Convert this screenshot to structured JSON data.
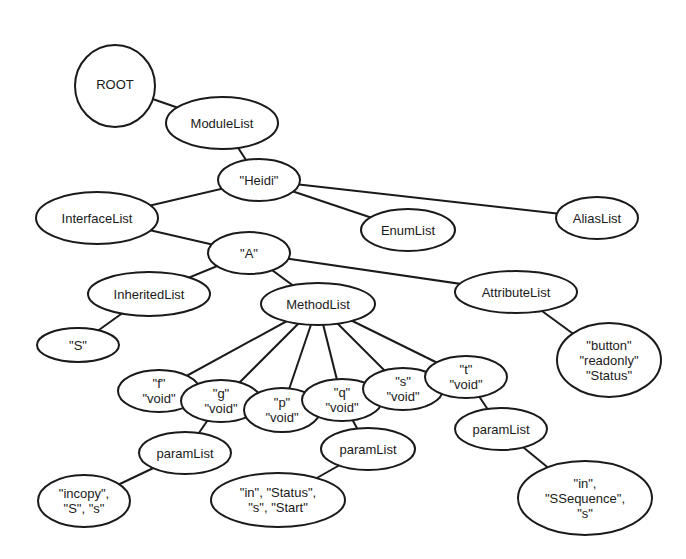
{
  "diagram": {
    "type": "tree",
    "colors": {
      "stroke": "#1a1a1a",
      "fill": "#ffffff",
      "text": "#1a1a1a",
      "background": "#ffffff"
    },
    "nodes": [
      {
        "id": "root",
        "shape": "circle",
        "cx": 115,
        "cy": 86,
        "rx": 40,
        "ry": 41,
        "lines": [
          "ROOT"
        ]
      },
      {
        "id": "modulelist",
        "shape": "ellipse",
        "cx": 222,
        "cy": 123,
        "rx": 56,
        "ry": 26,
        "lines": [
          "ModuleList"
        ]
      },
      {
        "id": "heidi",
        "shape": "ellipse",
        "cx": 259,
        "cy": 180,
        "rx": 41,
        "ry": 21,
        "lines": [
          "\"Heidi\""
        ]
      },
      {
        "id": "interfacelist",
        "shape": "ellipse",
        "cx": 97,
        "cy": 218,
        "rx": 61,
        "ry": 26,
        "lines": [
          "InterfaceList"
        ]
      },
      {
        "id": "enumlist",
        "shape": "ellipse",
        "cx": 408,
        "cy": 230,
        "rx": 47,
        "ry": 21,
        "lines": [
          "EnumList"
        ]
      },
      {
        "id": "aliaslist",
        "shape": "ellipse",
        "cx": 597,
        "cy": 218,
        "rx": 41,
        "ry": 21,
        "lines": [
          "AliasList"
        ]
      },
      {
        "id": "a",
        "shape": "ellipse",
        "cx": 249,
        "cy": 253,
        "rx": 41,
        "ry": 21,
        "lines": [
          "\"A\""
        ]
      },
      {
        "id": "inheritedlist",
        "shape": "ellipse",
        "cx": 149,
        "cy": 294,
        "rx": 61,
        "ry": 22,
        "lines": [
          "InheritedList"
        ]
      },
      {
        "id": "methodlist",
        "shape": "ellipse",
        "cx": 318,
        "cy": 304,
        "rx": 57,
        "ry": 21,
        "lines": [
          "MethodList"
        ]
      },
      {
        "id": "attributelist",
        "shape": "ellipse",
        "cx": 516,
        "cy": 292,
        "rx": 61,
        "ry": 21,
        "lines": [
          "AttributeList"
        ]
      },
      {
        "id": "s_inherited",
        "shape": "ellipse",
        "cx": 78,
        "cy": 345,
        "rx": 41,
        "ry": 17,
        "lines": [
          "\"S\""
        ]
      },
      {
        "id": "attr_button",
        "shape": "ellipse",
        "cx": 609,
        "cy": 360,
        "rx": 52,
        "ry": 37,
        "lines": [
          "\"button\"",
          "\"readonly\"",
          "\"Status\""
        ]
      },
      {
        "id": "m_f",
        "shape": "ellipse",
        "cx": 159,
        "cy": 391,
        "rx": 41,
        "ry": 21,
        "lines": [
          "\"f\"",
          "\"void\""
        ]
      },
      {
        "id": "m_g",
        "shape": "ellipse",
        "cx": 221,
        "cy": 401,
        "rx": 40,
        "ry": 21,
        "lines": [
          "\"g\"",
          "\"void\""
        ]
      },
      {
        "id": "m_p",
        "shape": "ellipse",
        "cx": 282,
        "cy": 410,
        "rx": 38,
        "ry": 22,
        "lines": [
          "\"p\"",
          "\"void\""
        ]
      },
      {
        "id": "m_q",
        "shape": "ellipse",
        "cx": 342,
        "cy": 400,
        "rx": 40,
        "ry": 21,
        "lines": [
          "\"q\"",
          "\"void\""
        ]
      },
      {
        "id": "m_s",
        "shape": "ellipse",
        "cx": 403,
        "cy": 389,
        "rx": 40,
        "ry": 21,
        "lines": [
          "\"s\"",
          "\"void\""
        ]
      },
      {
        "id": "m_t",
        "shape": "ellipse",
        "cx": 466,
        "cy": 377,
        "rx": 41,
        "ry": 21,
        "lines": [
          "\"t\"",
          "\"void\""
        ]
      },
      {
        "id": "paramlist_g",
        "shape": "ellipse",
        "cx": 185,
        "cy": 453,
        "rx": 46,
        "ry": 21,
        "lines": [
          "paramList"
        ]
      },
      {
        "id": "paramlist_q",
        "shape": "ellipse",
        "cx": 368,
        "cy": 449,
        "rx": 47,
        "ry": 21,
        "lines": [
          "paramList"
        ]
      },
      {
        "id": "paramlist_t",
        "shape": "ellipse",
        "cx": 501,
        "cy": 429,
        "rx": 46,
        "ry": 21,
        "lines": [
          "paramList"
        ]
      },
      {
        "id": "param_g",
        "shape": "ellipse",
        "cx": 84,
        "cy": 501,
        "rx": 46,
        "ry": 26,
        "lines": [
          "\"incopy\",",
          "\"S\", \"s\""
        ]
      },
      {
        "id": "param_q",
        "shape": "ellipse",
        "cx": 278,
        "cy": 500,
        "rx": 67,
        "ry": 27,
        "lines": [
          "\"in\", \"Status\",",
          "\"s\", \"Start\""
        ]
      },
      {
        "id": "param_t",
        "shape": "ellipse",
        "cx": 585,
        "cy": 498,
        "rx": 67,
        "ry": 37,
        "lines": [
          "\"in\",",
          "\"SSequence\",",
          "\"s\""
        ]
      }
    ],
    "edges": [
      [
        "root",
        "modulelist"
      ],
      [
        "modulelist",
        "heidi"
      ],
      [
        "heidi",
        "interfacelist"
      ],
      [
        "heidi",
        "enumlist"
      ],
      [
        "heidi",
        "aliaslist"
      ],
      [
        "interfacelist",
        "a"
      ],
      [
        "a",
        "inheritedlist"
      ],
      [
        "a",
        "methodlist"
      ],
      [
        "a",
        "attributelist"
      ],
      [
        "inheritedlist",
        "s_inherited"
      ],
      [
        "attributelist",
        "attr_button"
      ],
      [
        "methodlist",
        "m_f"
      ],
      [
        "methodlist",
        "m_g"
      ],
      [
        "methodlist",
        "m_p"
      ],
      [
        "methodlist",
        "m_q"
      ],
      [
        "methodlist",
        "m_s"
      ],
      [
        "methodlist",
        "m_t"
      ],
      [
        "m_g",
        "paramlist_g"
      ],
      [
        "m_q",
        "paramlist_q"
      ],
      [
        "m_t",
        "paramlist_t"
      ],
      [
        "paramlist_g",
        "param_g"
      ],
      [
        "paramlist_q",
        "param_q"
      ],
      [
        "paramlist_t",
        "param_t"
      ]
    ]
  }
}
